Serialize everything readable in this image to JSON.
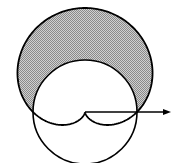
{
  "figure": {
    "pole": {
      "x": 85,
      "y": 112
    },
    "scale_a": 52,
    "curves": [
      {
        "name": "cardioid",
        "equation": "r = a(1 + sin θ)",
        "stroke": "#000000"
      },
      {
        "name": "circle",
        "equation": "r = a",
        "stroke": "#000000"
      }
    ],
    "shaded_region": {
      "description": "inside cardioid, outside circle",
      "fill": "#b8b8b8"
    },
    "polar_axis": {
      "direction": "right",
      "arrow": true,
      "end_x": 170
    }
  }
}
